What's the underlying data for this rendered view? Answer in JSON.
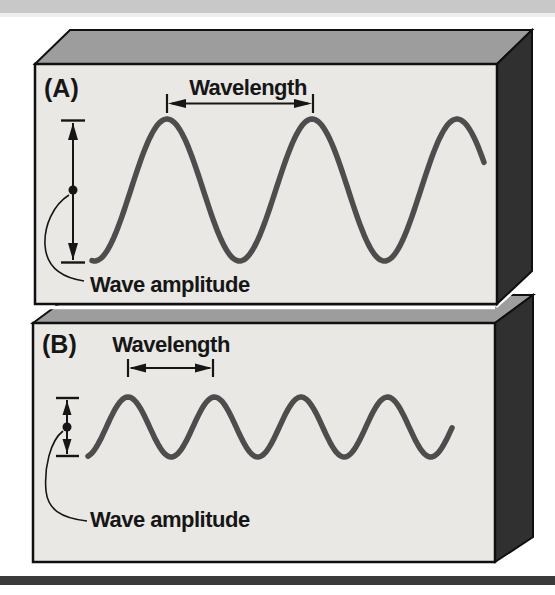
{
  "figure": {
    "panels": [
      {
        "label": "(A)",
        "wavelength_label": "Wavelength",
        "amplitude_label": "Wave amplitude"
      },
      {
        "label": "(B)",
        "wavelength_label": "Wavelength",
        "amplitude_label": "Wave amplitude"
      }
    ],
    "waves": [
      {
        "x_start": 92,
        "x_end": 484,
        "first_peak_x": 167,
        "period": 145,
        "midline_y": 190,
        "amplitude": 71
      },
      {
        "x_start": 88,
        "x_end": 453,
        "first_peak_x": 128,
        "period": 86.5,
        "midline_y": 427,
        "amplitude": 30
      }
    ],
    "colors": {
      "panel_face": "#e9e8e4",
      "panel_top": "#9d9d9d",
      "panel_side": "#303030",
      "outline": "#101010",
      "wave": "#4d4d4d",
      "top_bar": "#c8c8c8",
      "top_bar_fade": "#eeeeec",
      "bottom_bar": "#3a3a3a",
      "text": "#161616"
    }
  }
}
